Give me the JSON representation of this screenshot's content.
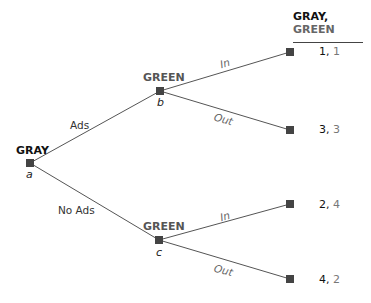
{
  "header": {
    "player1": "GRAY",
    "sep": ",",
    "player2": "GREEN"
  },
  "nodes": {
    "a": {
      "player": "GRAY",
      "id": "a"
    },
    "b": {
      "player": "GREEN",
      "id": "b"
    },
    "c": {
      "player": "GREEN",
      "id": "c"
    }
  },
  "branches": {
    "a_b": "Ads",
    "a_c": "No Ads",
    "b_in": "In",
    "b_out": "Out",
    "c_in": "In",
    "c_out": "Out"
  },
  "payoffs": [
    {
      "gray": "1",
      "green": "1"
    },
    {
      "gray": "3",
      "green": "3"
    },
    {
      "gray": "2",
      "green": "4"
    },
    {
      "gray": "4",
      "green": "2"
    }
  ],
  "colors": {
    "node": "#444444",
    "line": "#555555",
    "gray_text": "#111111",
    "green_text": "#666666"
  }
}
